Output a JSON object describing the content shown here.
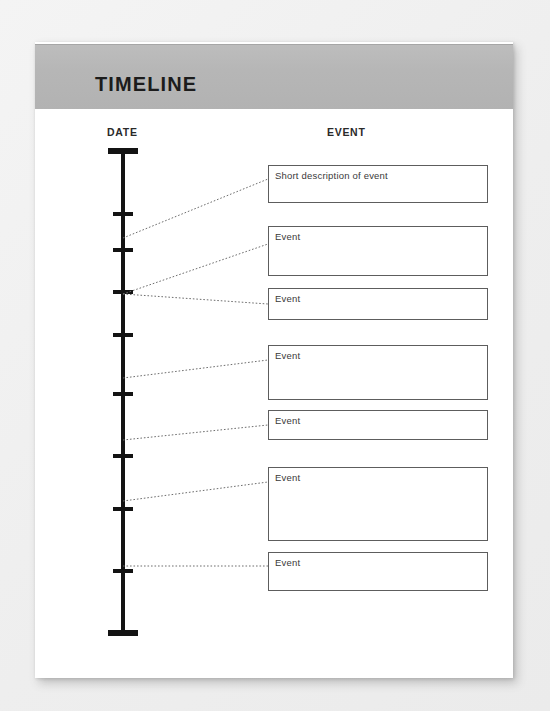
{
  "document": {
    "title": "TIMELINE",
    "columns": {
      "date_label": "DATE",
      "event_label": "EVENT"
    },
    "paper_color": "#ffffff",
    "header_band_color": "#b6b6b6",
    "background_color": "#f1f1f1",
    "line_color": "#131313"
  },
  "timeline": {
    "axis": {
      "top_y": 108,
      "bottom_y": 593,
      "x": 88
    },
    "ticks": [
      {
        "name": "tick-cap-top",
        "y": 108,
        "kind": "cap"
      },
      {
        "name": "tick-1",
        "y": 170,
        "kind": "minor"
      },
      {
        "name": "tick-2",
        "y": 206,
        "kind": "minor"
      },
      {
        "name": "tick-3",
        "y": 248,
        "kind": "minor"
      },
      {
        "name": "tick-4",
        "y": 291,
        "kind": "minor"
      },
      {
        "name": "tick-5",
        "y": 350,
        "kind": "minor"
      },
      {
        "name": "tick-6",
        "y": 412,
        "kind": "minor"
      },
      {
        "name": "tick-7",
        "y": 465,
        "kind": "minor"
      },
      {
        "name": "tick-8",
        "y": 527,
        "kind": "minor"
      },
      {
        "name": "tick-cap-bottom",
        "y": 591,
        "kind": "cap"
      }
    ],
    "connectors": [
      {
        "name": "connector-1",
        "from_y": 196,
        "to_y": 137
      },
      {
        "name": "connector-2",
        "from_y": 252,
        "to_y": 202
      },
      {
        "name": "connector-3",
        "from_y": 252,
        "to_y": 262
      },
      {
        "name": "connector-4",
        "from_y": 336,
        "to_y": 318
      },
      {
        "name": "connector-5",
        "from_y": 398,
        "to_y": 383
      },
      {
        "name": "connector-6",
        "from_y": 459,
        "to_y": 440
      },
      {
        "name": "connector-7",
        "from_y": 524,
        "to_y": 524
      }
    ],
    "events": [
      {
        "name": "event-box-1",
        "label": "Short description of event",
        "top": 123,
        "height": 38
      },
      {
        "name": "event-box-2",
        "label": "Event",
        "top": 184,
        "height": 50
      },
      {
        "name": "event-box-3",
        "label": "Event",
        "top": 246,
        "height": 32
      },
      {
        "name": "event-box-4",
        "label": "Event",
        "top": 303,
        "height": 55
      },
      {
        "name": "event-box-5",
        "label": "Event",
        "top": 368,
        "height": 30
      },
      {
        "name": "event-box-6",
        "label": "Event",
        "top": 425,
        "height": 74
      },
      {
        "name": "event-box-7",
        "label": "Event",
        "top": 510,
        "height": 39
      }
    ]
  }
}
